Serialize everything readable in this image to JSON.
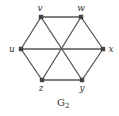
{
  "graph": {
    "caption": "G",
    "caption_sub": "2",
    "vertices": [
      {
        "id": "v",
        "label": "v",
        "x": 41,
        "y": 17,
        "lx": 40,
        "ly": 11
      },
      {
        "id": "w",
        "label": "w",
        "x": 81,
        "y": 17,
        "lx": 81,
        "ly": 11
      },
      {
        "id": "u",
        "label": "u",
        "x": 21,
        "y": 49,
        "lx": 12,
        "ly": 52
      },
      {
        "id": "x",
        "label": "x",
        "x": 103,
        "y": 49,
        "lx": 111,
        "ly": 52
      },
      {
        "id": "z",
        "label": "z",
        "x": 42,
        "y": 80,
        "lx": 41,
        "ly": 91
      },
      {
        "id": "y",
        "label": "y",
        "x": 82,
        "y": 80,
        "lx": 82,
        "ly": 91
      }
    ],
    "edges": [
      [
        "v",
        "w"
      ],
      [
        "w",
        "x"
      ],
      [
        "x",
        "y"
      ],
      [
        "y",
        "z"
      ],
      [
        "z",
        "u"
      ],
      [
        "u",
        "v"
      ],
      [
        "u",
        "x"
      ],
      [
        "v",
        "y"
      ],
      [
        "w",
        "z"
      ]
    ],
    "colors": {
      "edge": "#555555",
      "vertex": "#444444",
      "text": "#333333"
    }
  }
}
